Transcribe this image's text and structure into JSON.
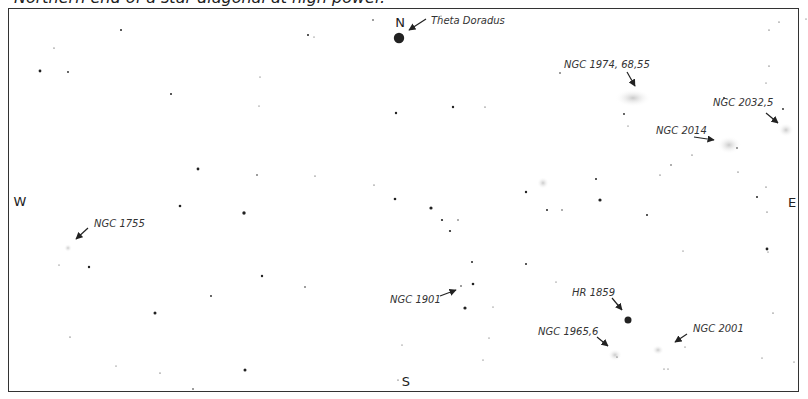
{
  "caption": "Northern end of a star diagonal at high power.",
  "directions": {
    "north": "N",
    "south": "S",
    "east": "E",
    "west": "W"
  },
  "labels": {
    "theta_doradus": "Theta Doradus",
    "ngc_1974": "NGC 1974, 68,55",
    "ngc_2032": "NGC 2032,5",
    "ngc_2014": "NGC 2014",
    "ngc_1755": "NGC 1755",
    "ngc_1901": "NGC 1901",
    "hr_1859": "HR 1859",
    "ngc_1965": "NGC 1965,6",
    "ngc_2001": "NGC 2001"
  },
  "colors": {
    "ink": "#222222",
    "nebula": "#bdbdbd",
    "frame": "#333333"
  }
}
